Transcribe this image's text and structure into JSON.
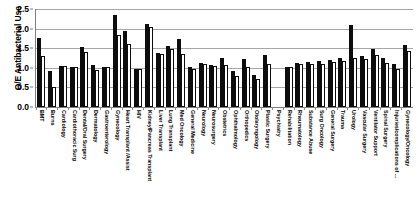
{
  "chart_data": {
    "type": "bar",
    "title": "",
    "xlabel": "",
    "ylabel": "O/E Antibacterial Use",
    "ylim": [
      0.0,
      2.5
    ],
    "ytick_labels": [
      "0.0",
      "0.5",
      "1.0",
      "1.5",
      "2.0",
      "2.5"
    ],
    "ytick_values": [
      0.0,
      0.5,
      1.0,
      1.5,
      2.0,
      2.5
    ],
    "grid": true,
    "legend": "none",
    "categories": [
      "BMT",
      "Burns",
      "Cardiology",
      "Cardiothoracic Surg",
      "Dental/Oral Surgery",
      "Dermatology",
      "Gastroenterology",
      "Gynecology",
      "Heart Transplant /Assist",
      "HIV",
      "Kidney/Pancreas Transplant",
      "Liver Transplant",
      "Lung Transplant",
      "Med Oncology",
      "General Medicine",
      "Neurology",
      "Neurosurgery",
      "Obstetrics",
      "Ophthalmology",
      "Orthopedics",
      "Otolaryngology",
      "Plastic Surgery",
      "Psychiatry",
      "Rehabilitation",
      "Rheumatology",
      "Substance Abuse",
      "Surg Oncology",
      "General Surgery",
      "Trauma",
      "Urology",
      "Vascular Surgery",
      "Ventilator Support",
      "Spinal Surgery",
      "Injuries/complications of ...",
      "Gynecology/Oncology"
    ],
    "series": [
      {
        "name": "observed",
        "color": "#0d0d0d",
        "values": [
          1.76,
          0.92,
          1.04,
          1.03,
          1.52,
          1.06,
          1.03,
          2.34,
          1.94,
          0.96,
          2.11,
          1.38,
          1.56,
          1.74,
          1.03,
          1.12,
          1.06,
          1.26,
          0.92,
          1.22,
          0.81,
          1.33,
          0.0,
          1.02,
          1.12,
          1.14,
          1.17,
          1.21,
          1.25,
          2.08,
          1.3,
          1.47,
          1.25,
          1.1,
          1.58
        ]
      },
      {
        "name": "expected",
        "color": "#ffffff",
        "values": [
          1.31,
          0.51,
          1.04,
          1.03,
          1.4,
          0.94,
          1.03,
          1.83,
          1.62,
          0.96,
          2.03,
          1.36,
          1.47,
          1.34,
          0.97,
          1.1,
          1.05,
          1.08,
          0.78,
          1.01,
          0.72,
          1.1,
          0.0,
          1.02,
          1.1,
          1.11,
          1.1,
          1.14,
          1.18,
          1.24,
          1.22,
          1.33,
          1.13,
          0.97,
          1.42
        ]
      }
    ]
  }
}
